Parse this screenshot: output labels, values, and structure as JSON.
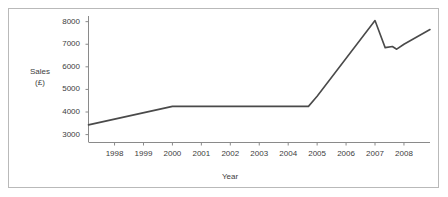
{
  "chart_data": {
    "type": "line",
    "title": "",
    "xlabel": "Year",
    "ylabel": "Sales (£)",
    "ylabel_lines": [
      "Sales",
      "(£)"
    ],
    "xlim": [
      1997.1,
      2008.9
    ],
    "ylim": [
      2650,
      8250
    ],
    "grid": false,
    "legend": null,
    "yticks": [
      3000,
      4000,
      5000,
      6000,
      7000,
      8000
    ],
    "ytick_labels": [
      "3000",
      "4000",
      "5000",
      "6000",
      "7000",
      "8000"
    ],
    "xticks": [
      1998,
      1999,
      2000,
      2001,
      2002,
      2003,
      2004,
      2005,
      2006,
      2007,
      2008
    ],
    "xtick_labels": [
      "1998",
      "1999",
      "2000",
      "2001",
      "2002",
      "2003",
      "2004",
      "2005",
      "2006",
      "2007",
      "2008"
    ],
    "series": [
      {
        "name": "Sales",
        "color": "#4a4a4a",
        "x": [
          1997.1,
          2000.0,
          2004.7,
          2005.0,
          2007.0,
          2007.35,
          2007.6,
          2007.75,
          2008.0,
          2008.9
        ],
        "values": [
          3430,
          4250,
          4250,
          4700,
          8050,
          6850,
          6900,
          6780,
          7000,
          7650
        ]
      }
    ]
  },
  "style": {
    "line_color": "#4a4a4a",
    "axis_color": "#8a8a8a",
    "frame_color": "#b9b9b9",
    "text_color": "#3d3d3d",
    "background": "#ffffff"
  }
}
